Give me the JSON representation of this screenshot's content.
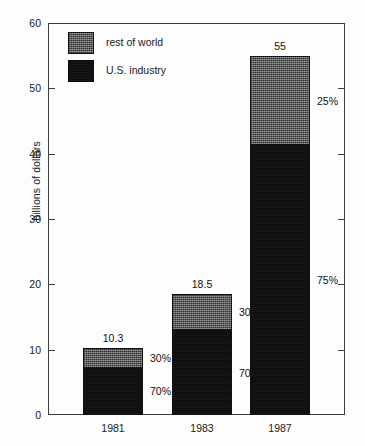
{
  "chart_data": {
    "type": "bar",
    "subtype": "stacked-bar",
    "title": "",
    "xlabel": "",
    "ylabel": "billions of dollars",
    "categories": [
      "1981",
      "1983",
      "1987"
    ],
    "totals": [
      10.3,
      18.5,
      55
    ],
    "total_labels": [
      "10.3",
      "18.5",
      "55"
    ],
    "ylim": [
      0,
      60
    ],
    "yticks": [
      0,
      10,
      20,
      30,
      40,
      50,
      60
    ],
    "ytick_labels": [
      "0",
      "10",
      "20",
      "30",
      "40",
      "50",
      "60"
    ],
    "grid": false,
    "legend_position": "upper-left-inside",
    "series": [
      {
        "name": "rest of world",
        "color": "#6e6e6e",
        "values": [
          3.09,
          5.55,
          13.75
        ],
        "percent_labels": [
          "30%",
          "30%",
          "25%"
        ]
      },
      {
        "name": "U.S. industry",
        "color": "#0d0d0d",
        "values": [
          7.21,
          12.95,
          41.25
        ],
        "percent_labels": [
          "70%",
          "70%",
          "75%"
        ]
      }
    ],
    "annotations": [
      {
        "text": "10.3",
        "kind": "bar-total",
        "category": "1981"
      },
      {
        "text": "18.5",
        "kind": "bar-total",
        "category": "1983"
      },
      {
        "text": "55",
        "kind": "bar-total",
        "category": "1987"
      },
      {
        "text": "30%",
        "kind": "segment-percent",
        "category": "1981",
        "series": "rest of world"
      },
      {
        "text": "70%",
        "kind": "segment-percent",
        "category": "1981",
        "series": "U.S. industry"
      },
      {
        "text": "30%",
        "kind": "segment-percent",
        "category": "1983",
        "series": "rest of world"
      },
      {
        "text": "70%",
        "kind": "segment-percent",
        "category": "1983",
        "series": "U.S. industry"
      },
      {
        "text": "25%",
        "kind": "segment-percent",
        "category": "1987",
        "series": "rest of world"
      },
      {
        "text": "75%",
        "kind": "segment-percent",
        "category": "1987",
        "series": "U.S. industry"
      }
    ]
  },
  "axis": {
    "y_title": "billions of dollars",
    "y_tick_labels": [
      "60",
      "50",
      "40",
      "30",
      "20",
      "10",
      "0"
    ],
    "x_tick_labels": [
      "1981",
      "1983",
      "1987"
    ]
  },
  "legend": {
    "items": [
      {
        "label": "rest of world",
        "swatch": "gray-hatched-swatch"
      },
      {
        "label": "U.S. industry",
        "swatch": "black-swatch"
      }
    ]
  },
  "colors": {
    "rest_of_world": "#6e6e6e",
    "us_industry": "#0d0d0d",
    "axis": "#3c3c3c",
    "background": "#fdfdfd",
    "text": "#1a1a1a"
  }
}
